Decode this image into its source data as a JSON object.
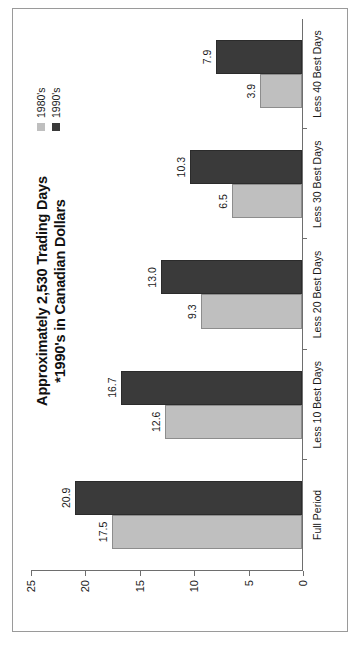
{
  "chart_data": {
    "type": "bar",
    "title": "Approximately 2,530 Trading Days\n*1990's in Canadian Dollars",
    "title_lines": [
      "Approximately 2,530 Trading Days",
      "*1990's in Canadian Dollars"
    ],
    "xlabel": "",
    "ylabel": "",
    "ylim": [
      0,
      25
    ],
    "yticks": [
      0,
      5,
      10,
      15,
      20,
      25
    ],
    "ytick_labels": [
      "0",
      "5",
      "10",
      "15",
      "20",
      "25"
    ],
    "grid": false,
    "legend_position": "top-right",
    "orientation": "vertical-bars-rotated-page",
    "categories": [
      "Full Period",
      "Less 10 Best Days",
      "Less 20 Best Days",
      "Less 30 Best Days",
      "Less 40 Best Days"
    ],
    "series": [
      {
        "name": "1980's",
        "color": "#bfbfbf",
        "values": [
          17.5,
          12.6,
          9.3,
          6.5,
          3.9
        ],
        "labels": [
          "17.5",
          "12.6",
          "9.3",
          "6.5",
          "3.9"
        ]
      },
      {
        "name": "1990's",
        "color": "#3a3a3a",
        "values": [
          20.9,
          16.7,
          13.0,
          10.3,
          7.9
        ],
        "labels": [
          "20.9",
          "16.7",
          "13.0",
          "10.3",
          "7.9"
        ]
      }
    ]
  },
  "legend": {
    "items": [
      {
        "label": "1980's",
        "color": "#bfbyf"
      },
      {
        "label": "1990's",
        "color": "#3a3a3a"
      }
    ]
  }
}
